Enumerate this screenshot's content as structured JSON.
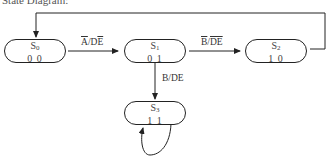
{
  "title": "State Diagram:",
  "states": [
    {
      "id": "S0",
      "name": "S",
      "sub": "0",
      "code": "0 0"
    },
    {
      "id": "S1",
      "name": "S",
      "sub": "1",
      "code": "0 1"
    },
    {
      "id": "S2",
      "name": "S",
      "sub": "2",
      "code": "1 0"
    },
    {
      "id": "S3",
      "name": "S",
      "sub": "3",
      "code": "1 1"
    }
  ],
  "transitions": [
    {
      "from": "S0",
      "to": "S1",
      "label": "A̅/DE̅",
      "parts": [
        {
          "t": "A",
          "bar": true
        },
        {
          "t": "/D",
          "bar": false
        },
        {
          "t": "E",
          "bar": true
        }
      ]
    },
    {
      "from": "S1",
      "to": "S2",
      "label": "B̅/D̅E̅",
      "parts": [
        {
          "t": "B",
          "bar": true
        },
        {
          "t": "/",
          "bar": false
        },
        {
          "t": "DE",
          "bar": true
        }
      ]
    },
    {
      "from": "S1",
      "to": "S3",
      "label": "B/DE",
      "parts": [
        {
          "t": "B/DE",
          "bar": false
        }
      ]
    },
    {
      "from": "S2",
      "to": "S0",
      "label": ""
    },
    {
      "from": "S3",
      "to": "S3",
      "label": ""
    }
  ],
  "colors": {
    "stroke": "#222222",
    "text": "#444444",
    "background": "#ffffff"
  }
}
